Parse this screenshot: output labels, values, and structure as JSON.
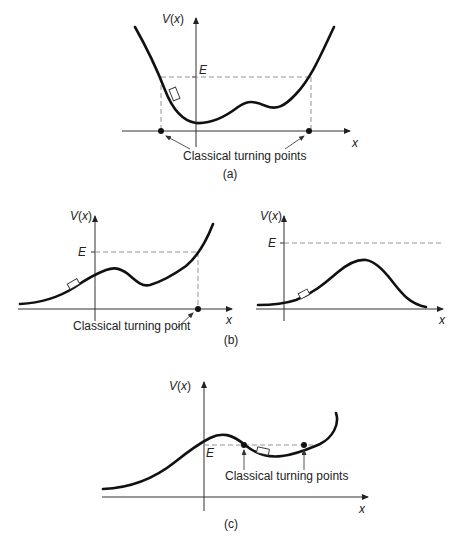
{
  "figure": {
    "panels": [
      {
        "id": "a",
        "caption": "(a)",
        "y_axis_label": "V(x)",
        "x_axis_label": "x",
        "energy_label": "E",
        "annotation": "Classical turning points",
        "description": "Double-well potential; particle bounded between two turning points where E = V(x)"
      },
      {
        "id": "b-left",
        "caption": "(b)",
        "y_axis_label": "V(x)",
        "x_axis_label": "x",
        "energy_label": "E",
        "annotation": "Classical turning point",
        "description": "Potential with a bump below E rising on the right; single turning point"
      },
      {
        "id": "b-right",
        "caption": "",
        "y_axis_label": "V(x)",
        "x_axis_label": "x",
        "energy_label": "E",
        "annotation": "",
        "description": "Barrier entirely below E; no turning points"
      },
      {
        "id": "c",
        "caption": "(c)",
        "y_axis_label": "V(x)",
        "x_axis_label": "x",
        "energy_label": "E",
        "annotation": "Classical turning points",
        "description": "Particle confined in a shallow well between two turning points with E just below barrier top"
      }
    ]
  }
}
